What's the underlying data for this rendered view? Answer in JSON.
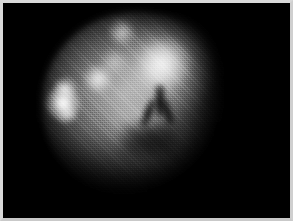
{
  "image": {
    "kind": "scintigraphy-scan",
    "modality_label": "Nuclear medicine planar scan",
    "alt_text": "Grayscale planar nuclear medicine scan showing a roughly circular region of diffuse radiotracer uptake with several intense focal hot spots and a dark Y-shaped photopenic defect near the center.",
    "colormap": "grayscale",
    "background_color": "#000000",
    "frame_color": "#d9d9d9",
    "plate_color": "#000000",
    "peak_intensity_color": "#ffffff",
    "width_px": 293,
    "height_px": 221
  },
  "field": {
    "shape": "circular",
    "center_x_px": 136,
    "center_y_px": 102,
    "radius_x_px": 97,
    "radius_y_px": 93,
    "mean_gray": "#8a8a8a"
  },
  "features": {
    "hot_spots": [
      {
        "name": "dominant-superior-focus",
        "x_px": 163,
        "y_px": 63,
        "radius_px": 9,
        "intensity": 1.0,
        "note": "brightest focal uptake"
      },
      {
        "name": "superior-focus-halo",
        "x_px": 162,
        "y_px": 66,
        "radius_px": 25,
        "intensity": 0.62,
        "note": "surrounding diffuse rim"
      },
      {
        "name": "left-lateral-focus-main",
        "x_px": 62,
        "y_px": 101,
        "radius_px": 7,
        "intensity": 0.98
      },
      {
        "name": "left-lateral-focus-upper",
        "x_px": 64,
        "y_px": 88,
        "radius_px": 4,
        "intensity": 0.8
      },
      {
        "name": "left-lateral-focus-lower",
        "x_px": 66,
        "y_px": 114,
        "radius_px": 4,
        "intensity": 0.66
      },
      {
        "name": "mid-left-focus",
        "x_px": 97,
        "y_px": 78,
        "radius_px": 5,
        "intensity": 0.86
      },
      {
        "name": "superior-small-focus",
        "x_px": 122,
        "y_px": 32,
        "radius_px": 4,
        "intensity": 0.72
      },
      {
        "name": "central-faint-focus",
        "x_px": 114,
        "y_px": 62,
        "radius_px": 4,
        "intensity": 0.55
      },
      {
        "name": "inferior-central-focus",
        "x_px": 132,
        "y_px": 124,
        "radius_px": 9,
        "intensity": 0.48
      }
    ],
    "cold_spots": [
      {
        "name": "central-y-defect-stem",
        "x_px": 160,
        "y_px": 99,
        "width_px": 5,
        "height_px": 26,
        "note": "vertical photopenic stem"
      },
      {
        "name": "central-y-defect-left-arm",
        "x_px": 150,
        "y_px": 110,
        "width_px": 5,
        "height_px": 20
      },
      {
        "name": "central-y-defect-right-arm",
        "x_px": 170,
        "y_px": 110,
        "width_px": 5,
        "height_px": 18
      },
      {
        "name": "inferior-central-defect",
        "x_px": 142,
        "y_px": 140,
        "width_px": 34,
        "height_px": 20
      }
    ]
  }
}
